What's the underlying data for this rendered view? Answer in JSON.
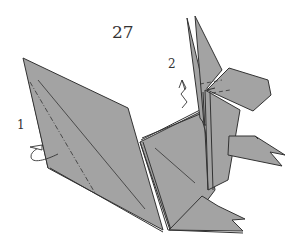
{
  "diagram": {
    "step_number": "27",
    "annotations": [
      {
        "id": "1",
        "label": "1",
        "description": "fold behind (tail edge)"
      },
      {
        "id": "2",
        "label": "2",
        "description": "pleat / pull up"
      }
    ],
    "colors": {
      "paper": "#a3a3a3",
      "line": "#333333",
      "background": "#ffffff"
    }
  }
}
